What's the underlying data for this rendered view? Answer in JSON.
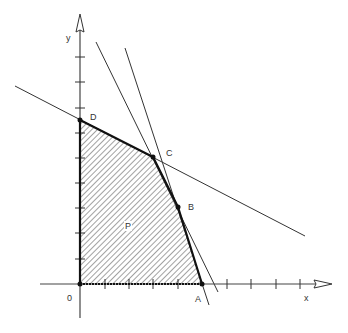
{
  "diagram": {
    "type": "linear-programming-feasible-region",
    "axes": {
      "x_label": "x",
      "y_label": "y",
      "origin_label": "0",
      "origin_px": [
        80,
        284
      ],
      "tick_spacing_px": 24.5,
      "x_ticks_px": [
        105,
        129,
        153,
        178,
        227,
        251,
        276,
        300
      ],
      "y_ticks_px": [
        57,
        82,
        108,
        133,
        158,
        183,
        208,
        233,
        259
      ]
    },
    "vertices": [
      {
        "name": "O",
        "label": "0",
        "px": [
          80,
          284
        ]
      },
      {
        "name": "A",
        "label": "A",
        "px": [
          202,
          284
        ]
      },
      {
        "name": "B",
        "label": "B",
        "px": [
          178,
          207
        ]
      },
      {
        "name": "C",
        "label": "C",
        "px": [
          153,
          157
        ]
      },
      {
        "name": "D",
        "label": "D",
        "px": [
          80,
          120
        ]
      }
    ],
    "region_label": "P",
    "constraint_lines": [
      {
        "id": "line-dc",
        "from": [
          15,
          86
        ],
        "to": [
          305,
          236
        ]
      },
      {
        "id": "line-cb",
        "from": [
          96,
          42
        ],
        "to": [
          218,
          292
        ]
      },
      {
        "id": "line-ba",
        "from": [
          125,
          48
        ],
        "to": [
          209,
          305
        ]
      }
    ],
    "colors": {
      "stroke": "#222222",
      "hatch": "#888888",
      "background": "#ffffff"
    }
  }
}
